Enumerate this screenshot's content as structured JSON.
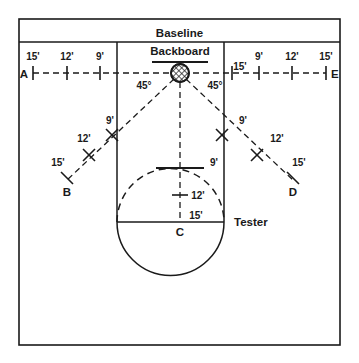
{
  "diagram": {
    "title_band": "Baseline",
    "backboard_label": "Backboard",
    "tester_label": "Tester",
    "hoop_icon": "hatched-circle-hoop-icon",
    "angles": {
      "left": "45°",
      "right": "45°"
    },
    "points": {
      "a": "A",
      "b": "B",
      "c": "C",
      "d": "D",
      "e": "E"
    },
    "baseline_left_distances": [
      "15'",
      "12'",
      "9'"
    ],
    "baseline_right_near": "15'",
    "baseline_right_distances": [
      "9'",
      "12'",
      "15'"
    ],
    "diagonal_left_distances": [
      "9'",
      "12'",
      "15'"
    ],
    "diagonal_right_distances": [
      "9'",
      "12'",
      "15'"
    ],
    "center_distances": [
      "9'",
      "12'",
      "15'"
    ],
    "colors": {
      "line": "#1a1a1a",
      "background": "#ffffff",
      "text": "#1a1a1a"
    }
  }
}
